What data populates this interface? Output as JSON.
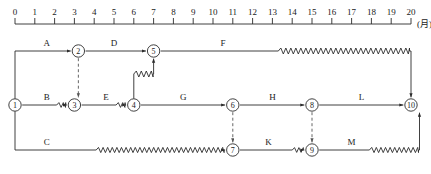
{
  "figure": {
    "type": "time-scaled-network-diagram"
  },
  "axis": {
    "unit_label": "(月)",
    "min": 0,
    "max": 20,
    "tick_step": 1,
    "tick_labels": [
      "0",
      "1",
      "2",
      "3",
      "4",
      "5",
      "6",
      "7",
      "8",
      "9",
      "10",
      "11",
      "12",
      "13",
      "14",
      "15",
      "16",
      "17",
      "18",
      "19",
      "20"
    ]
  },
  "nodes": [
    {
      "id": "1",
      "label": "1",
      "time": 0,
      "row": "middle"
    },
    {
      "id": "2",
      "label": "2",
      "time": 3.2,
      "row": "top"
    },
    {
      "id": "3",
      "label": "3",
      "time": 3,
      "row": "middle"
    },
    {
      "id": "4",
      "label": "4",
      "time": 6,
      "row": "middle"
    },
    {
      "id": "5",
      "label": "5",
      "time": 7,
      "row": "top"
    },
    {
      "id": "6",
      "label": "6",
      "time": 11,
      "row": "middle"
    },
    {
      "id": "7",
      "label": "7",
      "time": 11,
      "row": "bottom"
    },
    {
      "id": "8",
      "label": "8",
      "time": 15,
      "row": "middle"
    },
    {
      "id": "9",
      "label": "9",
      "time": 15,
      "row": "bottom"
    },
    {
      "id": "10",
      "label": "10",
      "time": 20,
      "row": "middle"
    }
  ],
  "activities": [
    {
      "name": "A",
      "from": "1",
      "to": "2",
      "label_time": 1.6,
      "row": "top",
      "has_float": false
    },
    {
      "name": "D",
      "from": "2",
      "to": "5",
      "label_time": 5.0,
      "row": "top",
      "has_float": false
    },
    {
      "name": "F",
      "from": "5",
      "to": "10",
      "label_time": 10.5,
      "row": "top",
      "has_float": true
    },
    {
      "name": "B",
      "from": "1",
      "to": "3",
      "label_time": 1.6,
      "row": "middle",
      "has_float": true
    },
    {
      "name": "E",
      "from": "3",
      "to": "4",
      "label_time": 4.6,
      "row": "middle",
      "has_float": true
    },
    {
      "name": "G",
      "from": "4",
      "to": "6",
      "label_time": 8.5,
      "row": "middle",
      "has_float": false
    },
    {
      "name": "H",
      "from": "6",
      "to": "8",
      "label_time": 13.0,
      "row": "middle",
      "has_float": false
    },
    {
      "name": "L",
      "from": "8",
      "to": "10",
      "label_time": 17.5,
      "row": "middle",
      "has_float": false
    },
    {
      "name": "C",
      "from": "1",
      "to": "7",
      "label_time": 1.6,
      "row": "bottom",
      "has_float": true
    },
    {
      "name": "K",
      "from": "7",
      "to": "9",
      "label_time": 12.8,
      "row": "bottom",
      "has_float": true
    },
    {
      "name": "M",
      "from": "9",
      "to": "10",
      "label_time": 17.0,
      "row": "bottom",
      "has_float": true
    }
  ],
  "dummy_links": [
    {
      "from": "2",
      "to": "3"
    },
    {
      "from": "6",
      "to": "7"
    },
    {
      "from": "8",
      "to": "9"
    }
  ],
  "colors": {
    "stroke": "#2b2b2b",
    "dummy_stroke": "#555555",
    "text": "#1a1a1a",
    "background": "#ffffff"
  }
}
